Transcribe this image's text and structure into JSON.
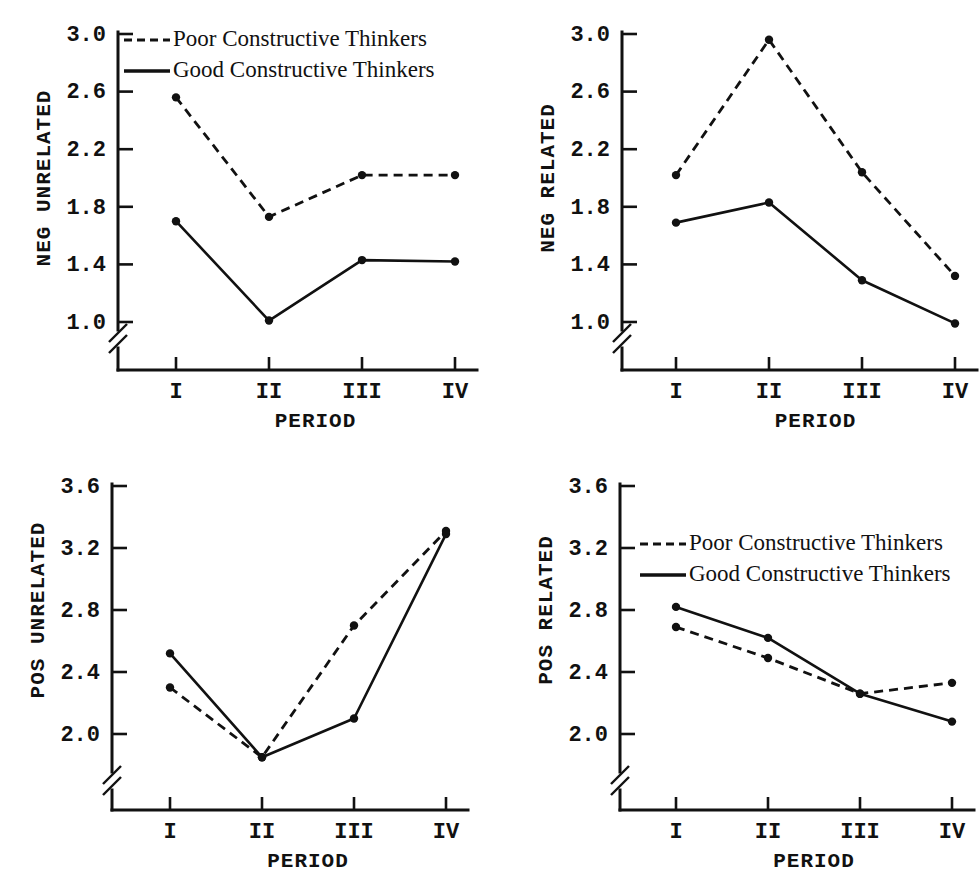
{
  "figure": {
    "panel_count": 4,
    "legend_entries": [
      {
        "label": "Poor Constructive Thinkers",
        "style": "dashed"
      },
      {
        "label": "Good Constructive Thinkers",
        "style": "solid"
      }
    ]
  },
  "chart_data": [
    {
      "type": "line",
      "panel": "top-left",
      "title": "",
      "xlabel": "PERIOD",
      "ylabel": "NEG UNRELATED",
      "categories": [
        "I",
        "II",
        "III",
        "IV"
      ],
      "ytick_labels": [
        "1.0",
        "1.4",
        "1.8",
        "2.2",
        "2.6",
        "3.0"
      ],
      "ytick_values": [
        1.0,
        1.4,
        1.8,
        2.2,
        2.6,
        3.0
      ],
      "ylim": [
        1.0,
        3.0
      ],
      "axis_break": true,
      "grid": false,
      "legend_position": "top-left-inside",
      "show_legend": true,
      "series": [
        {
          "name": "Poor Constructive Thinkers",
          "style": "dashed",
          "values": [
            2.56,
            1.73,
            2.02,
            2.02
          ]
        },
        {
          "name": "Good Constructive Thinkers",
          "style": "solid",
          "values": [
            1.7,
            1.01,
            1.43,
            1.42
          ]
        }
      ]
    },
    {
      "type": "line",
      "panel": "top-right",
      "title": "",
      "xlabel": "PERIOD",
      "ylabel": "NEG RELATED",
      "categories": [
        "I",
        "II",
        "III",
        "IV"
      ],
      "ytick_labels": [
        "1.0",
        "1.4",
        "1.8",
        "2.2",
        "2.6",
        "3.0"
      ],
      "ytick_values": [
        1.0,
        1.4,
        1.8,
        2.2,
        2.6,
        3.0
      ],
      "ylim": [
        1.0,
        3.0
      ],
      "axis_break": true,
      "grid": false,
      "legend_position": "none",
      "show_legend": false,
      "series": [
        {
          "name": "Poor Constructive Thinkers",
          "style": "dashed",
          "values": [
            2.02,
            2.96,
            2.04,
            1.32
          ]
        },
        {
          "name": "Good Constructive Thinkers",
          "style": "solid",
          "values": [
            1.69,
            1.83,
            1.29,
            0.99
          ]
        }
      ]
    },
    {
      "type": "line",
      "panel": "bottom-left",
      "title": "",
      "xlabel": "PERIOD",
      "ylabel": "POS UNRELATED",
      "categories": [
        "I",
        "II",
        "III",
        "IV"
      ],
      "ytick_labels": [
        "2.0",
        "2.4",
        "2.8",
        "3.2",
        "3.6"
      ],
      "ytick_values": [
        2.0,
        2.4,
        2.8,
        3.2,
        3.6
      ],
      "ylim": [
        2.0,
        3.6
      ],
      "axis_break": true,
      "grid": false,
      "legend_position": "none",
      "show_legend": false,
      "series": [
        {
          "name": "Poor Constructive Thinkers",
          "style": "dashed",
          "values": [
            2.3,
            1.85,
            2.7,
            3.31
          ]
        },
        {
          "name": "Good Constructive Thinkers",
          "style": "solid",
          "values": [
            2.52,
            1.85,
            2.1,
            3.29
          ]
        }
      ]
    },
    {
      "type": "line",
      "panel": "bottom-right",
      "title": "",
      "xlabel": "PERIOD",
      "ylabel": "POS RELATED",
      "categories": [
        "I",
        "II",
        "III",
        "IV"
      ],
      "ytick_labels": [
        "2.0",
        "2.4",
        "2.8",
        "3.2",
        "3.6"
      ],
      "ytick_values": [
        2.0,
        2.4,
        2.8,
        3.2,
        3.6
      ],
      "ylim": [
        2.0,
        3.6
      ],
      "axis_break": true,
      "grid": false,
      "legend_position": "top-left-inside",
      "show_legend": true,
      "series": [
        {
          "name": "Poor Constructive Thinkers",
          "style": "dashed",
          "values": [
            2.69,
            2.49,
            2.26,
            2.33
          ]
        },
        {
          "name": "Good Constructive Thinkers",
          "style": "solid",
          "values": [
            2.82,
            2.62,
            2.26,
            2.08
          ]
        }
      ]
    }
  ]
}
